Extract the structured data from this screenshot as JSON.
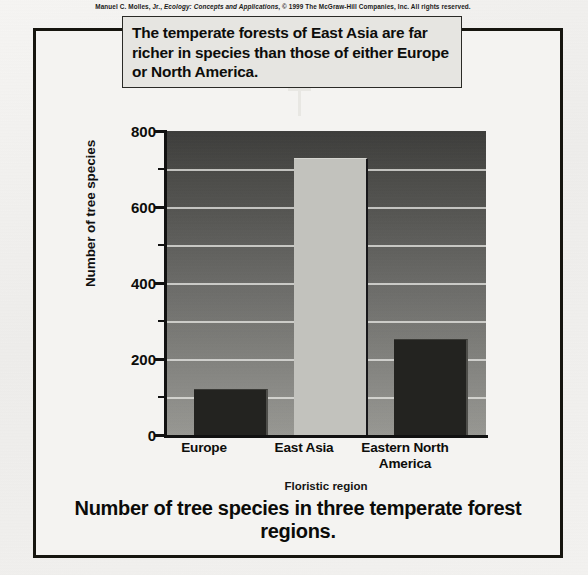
{
  "credit": {
    "author": "Manuel C. Molles, Jr.,",
    "book_title": "Ecology: Concepts and Applications",
    "rights": ", © 1999 The McGraw-Hill Companies, Inc. All rights reserved."
  },
  "callout": {
    "text": "The temperate forests of East Asia are far richer in species than those of either Europe or North America."
  },
  "caption": {
    "text": "Number of tree species in three temperate forest regions."
  },
  "chart_data": {
    "type": "bar",
    "title": "Number of tree species in three temperate forest regions.",
    "categories": [
      "Europe",
      "East Asia",
      "Eastern North America"
    ],
    "values": [
      120,
      729,
      253
    ],
    "xlabel": "Floristic region",
    "ylabel": "Number of tree species",
    "ylim": [
      0,
      800
    ],
    "yticks": [
      0,
      200,
      400,
      600,
      800
    ],
    "ytick_labels": [
      "0",
      "200",
      "400",
      "600",
      "800"
    ],
    "yminor_ticks": [
      100,
      300,
      500,
      700
    ],
    "grid": true,
    "gridlines_at": [
      100,
      200,
      300,
      400,
      500,
      600,
      700
    ],
    "legend": "none",
    "bar_colors": [
      "#232320",
      "#c2c2bd",
      "#232320"
    ],
    "plot_background": "gray-vertical-gradient",
    "annotation": "The temperate forests of East Asia are far richer in species than those of either Europe or North America."
  },
  "axis": {
    "y_labels": [
      "800",
      "600",
      "400",
      "200",
      "0"
    ],
    "x_title": "Floristic region",
    "y_title": "Number of tree species"
  },
  "categories_display": [
    {
      "label": "Europe",
      "line2": ""
    },
    {
      "label": "East Asia",
      "line2": ""
    },
    {
      "label": "Eastern North",
      "line2": "America"
    }
  ]
}
